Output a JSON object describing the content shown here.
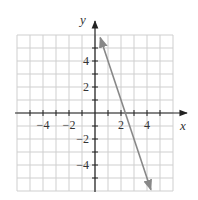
{
  "chart_data": {
    "type": "line",
    "title": "",
    "xlabel": "x",
    "ylabel": "y",
    "xlim": [
      -6,
      6
    ],
    "ylim": [
      -6,
      6
    ],
    "grid": true,
    "x_ticks": [
      -4,
      -2,
      2,
      4
    ],
    "y_ticks": [
      4,
      2,
      -2,
      -4
    ],
    "x_tick_labels": [
      "−4",
      "−2",
      "2",
      "4"
    ],
    "y_tick_labels": [
      "4",
      "2",
      "−2",
      "−4"
    ],
    "series": [
      {
        "name": "line",
        "equation": "y = -3x + 7",
        "x": [
          0.4,
          4.3
        ],
        "y": [
          5.8,
          -5.9
        ],
        "color": "#888888",
        "arrows": "both"
      }
    ],
    "legend": null
  },
  "colors": {
    "grid": "#cfcfcf",
    "axis": "#222222",
    "line": "#888888",
    "text": "#333333"
  }
}
